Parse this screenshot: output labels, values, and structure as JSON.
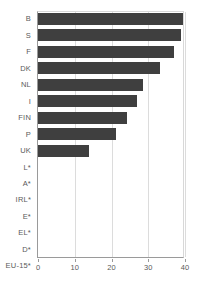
{
  "chart_data": {
    "type": "bar",
    "orientation": "horizontal",
    "title": "",
    "subtitle": "",
    "xlabel": "",
    "ylabel": "",
    "xlim": [
      0,
      40
    ],
    "xticks": [
      0,
      10,
      20,
      30,
      40
    ],
    "xtick_labels": [
      "0",
      "10",
      "20",
      "30",
      "40"
    ],
    "grid": true,
    "grid_axis": "x",
    "legend": false,
    "legend_position": "none",
    "bar_color": "#3f3f3f",
    "gridline_color": "#dcdcdc",
    "axis_color": "#9a9a9a",
    "tick_label_color": "#5a5a5a",
    "categories": [
      "B",
      "S",
      "F",
      "DK",
      "NL",
      "I",
      "FIN",
      "P",
      "UK",
      "L*",
      "A*",
      "IRL*",
      "E*",
      "EL*",
      "D*",
      "EU-15*"
    ],
    "values": [
      39.4,
      38.9,
      37.0,
      33.2,
      28.5,
      27.0,
      24.2,
      21.2,
      14.0,
      0,
      0,
      0,
      0,
      0,
      0,
      0
    ],
    "bars": [
      {
        "label": "B",
        "value": 39.4
      },
      {
        "label": "S",
        "value": 38.9
      },
      {
        "label": "F",
        "value": 37.0
      },
      {
        "label": "DK",
        "value": 33.2
      },
      {
        "label": "NL",
        "value": 28.5
      },
      {
        "label": "I",
        "value": 27.0
      },
      {
        "label": "FIN",
        "value": 24.2
      },
      {
        "label": "P",
        "value": 21.2
      },
      {
        "label": "UK",
        "value": 14.0
      },
      {
        "label": "L*",
        "value": 0
      },
      {
        "label": "A*",
        "value": 0
      },
      {
        "label": "IRL*",
        "value": 0
      },
      {
        "label": "E*",
        "value": 0
      },
      {
        "label": "EL*",
        "value": 0
      },
      {
        "label": "D*",
        "value": 0
      },
      {
        "label": "EU-15*",
        "value": 0
      }
    ]
  }
}
